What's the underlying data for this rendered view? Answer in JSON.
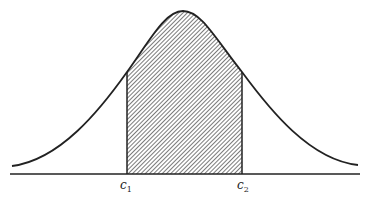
{
  "diagram": {
    "title": "",
    "type": "normal-distribution-shaded-interval",
    "curve": "bell-shaped density",
    "shaded_region": "area under curve between c1 and c2",
    "labels": {
      "c1": {
        "base": "c",
        "sub": "1"
      },
      "c2": {
        "base": "c",
        "sub": "2"
      }
    },
    "colors": {
      "line": "#222222",
      "background": "#ffffff",
      "hatch": "#333333"
    }
  }
}
